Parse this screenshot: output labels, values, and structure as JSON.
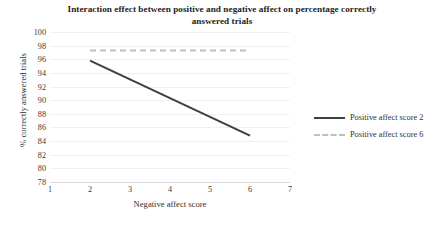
{
  "chart_data": {
    "type": "line",
    "title": "Interaction effect between positive and negative affect on percentage correctly answered trials",
    "xlabel": "Negative affect score",
    "ylabel": "% correctly answered trials",
    "xlim": [
      1,
      7
    ],
    "ylim": [
      78,
      100
    ],
    "xticks": [
      1,
      2,
      3,
      4,
      5,
      6,
      7
    ],
    "yticks": [
      78,
      80,
      82,
      84,
      86,
      88,
      90,
      92,
      94,
      96,
      98,
      100
    ],
    "grid": true,
    "legend_position": "right",
    "x": [
      2,
      6
    ],
    "series": [
      {
        "name": "Positive affect score 2",
        "values": [
          95.8,
          84.8
        ],
        "style": "solid",
        "color": "#404040"
      },
      {
        "name": "Positive affect score 6",
        "values": [
          97.3,
          97.3
        ],
        "style": "dashed",
        "color": "#bfbfbf"
      }
    ]
  },
  "legend": {
    "items": [
      {
        "label": "Positive affect score 2"
      },
      {
        "label": "Positive affect score 6"
      }
    ]
  },
  "colors": {
    "series_1": "#404040",
    "series_2": "#bfbfbf",
    "gridline": "#f0f0f2",
    "axis": "#d9d9dd",
    "text": "#2e2e2e"
  }
}
